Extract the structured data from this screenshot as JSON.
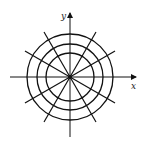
{
  "diagram": {
    "type": "polar-grid",
    "axes": {
      "x_label": "x",
      "y_label": "y"
    },
    "center": [
      70,
      77
    ],
    "circle_radii": [
      24,
      33,
      43
    ],
    "radial_line_angles_deg": [
      30,
      60,
      120,
      150
    ],
    "radial_line_length": 52,
    "colors": {
      "stroke": "#111111",
      "background": "#ffffff"
    }
  }
}
